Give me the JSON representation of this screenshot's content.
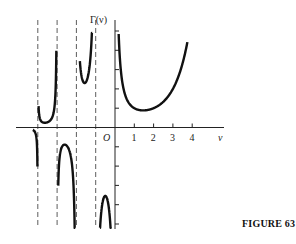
{
  "caption": "FIGURE 63",
  "chart_data": {
    "type": "line",
    "title": "",
    "function": "Gamma",
    "ylabel": "Γ(ν)",
    "xlabel": "ν",
    "origin_label": "O",
    "x_tick_labels": [
      "1",
      "2",
      "3",
      "4"
    ],
    "x_ticks": [
      1,
      2,
      3,
      4
    ],
    "y_ticks": [
      -5,
      -4,
      -3,
      -2,
      -1,
      1,
      2,
      3,
      4,
      5
    ],
    "xlim": [
      -4.4,
      5.4
    ],
    "ylim": [
      -5.2,
      4.6
    ],
    "asymptotes": [
      -4,
      -3,
      -2,
      -1
    ],
    "grid": false,
    "series": [
      {
        "name": "Γ(ν), ν>0",
        "domain": [
          0.19,
          3.75
        ]
      },
      {
        "name": "Γ(ν), -1<ν<0",
        "domain": [
          -0.78,
          -0.18
        ]
      },
      {
        "name": "Γ(ν), -2<ν<-1",
        "domain": [
          -1.82,
          -1.18
        ]
      },
      {
        "name": "Γ(ν), -3<ν<-2",
        "domain": [
          -2.94,
          -2.06
        ]
      },
      {
        "name": "Γ(ν), -4<ν<-3",
        "domain": [
          -3.96,
          -3.04
        ]
      },
      {
        "name": "Γ(ν), ν<-4",
        "domain": [
          -4.25,
          -4.02
        ]
      }
    ],
    "key_points": [
      {
        "x": 1.46,
        "y": 0.886,
        "label": "minimum"
      },
      {
        "x": -0.5,
        "y": -3.545
      },
      {
        "x": -1.5,
        "y": 2.363
      },
      {
        "x": -2.61,
        "y": -0.888
      },
      {
        "x": -3.64,
        "y": 0.245
      }
    ]
  }
}
